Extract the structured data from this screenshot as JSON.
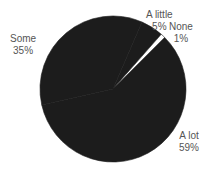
{
  "chart_data": {
    "type": "pie",
    "title": "",
    "categories": [
      "A lot",
      "Some",
      "A little",
      "None"
    ],
    "values": [
      59,
      35,
      5,
      1
    ],
    "value_labels": [
      "59%",
      "35%",
      "5%",
      "1%"
    ],
    "colors": [
      "#1c1c1c",
      "#1c1c1c",
      "#1c1c1c",
      "#ffffff"
    ],
    "legend": "none",
    "labels_outside": true
  },
  "labels": {
    "a_lot": {
      "name": "A lot",
      "pct": "59%"
    },
    "some": {
      "name": "Some",
      "pct": "35%"
    },
    "a_little": {
      "name": "A little",
      "pct": "5%"
    },
    "none": {
      "name": "None",
      "pct": "1%"
    }
  }
}
